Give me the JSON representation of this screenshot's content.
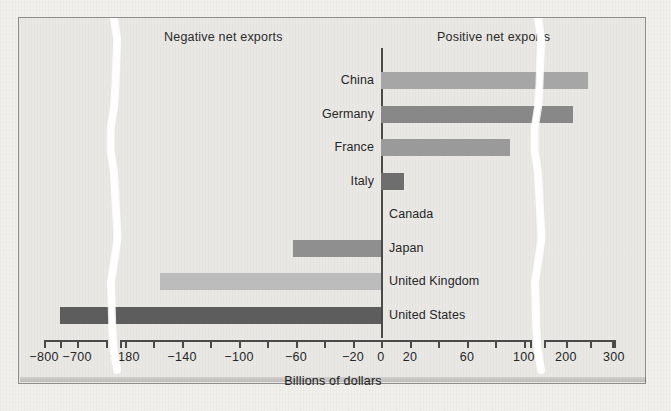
{
  "figure": {
    "header_negative": "Negative net exports",
    "header_positive": "Positive net exports",
    "axis_title": "Billions of dollars"
  },
  "chart_data": {
    "type": "bar",
    "orientation": "horizontal",
    "title": "",
    "subtitle": "",
    "xlabel": "Billions of dollars",
    "ylabel": "",
    "grid": false,
    "legend": null,
    "axis_breaks": [
      {
        "between": [
          -700,
          -180
        ],
        "pixel_x": 113
      },
      {
        "between": [
          100,
          200
        ],
        "pixel_x": 537
      }
    ],
    "xlim": [
      -800,
      300
    ],
    "xticks": [
      -800,
      -700,
      -180,
      -160,
      -140,
      -120,
      -100,
      -80,
      -60,
      -40,
      -20,
      0,
      20,
      40,
      60,
      80,
      100,
      200,
      250,
      300
    ],
    "xtick_labels": [
      "−800",
      "−700",
      "−180",
      "−140",
      "−100",
      "−60",
      "−20",
      "0",
      "20",
      "60",
      "100",
      "200",
      "300"
    ],
    "categories": [
      "China",
      "Germany",
      "France",
      "Italy",
      "Canada",
      "Japan",
      "United Kingdom",
      "United States"
    ],
    "values": [
      245,
      215,
      90,
      16,
      0,
      -62,
      -155,
      -750
    ],
    "annotations": [
      "Negative net exports",
      "Positive net exports"
    ]
  },
  "bars": [
    {
      "label": "China",
      "value": 245,
      "color": "#a6a6a6",
      "label_side": "left"
    },
    {
      "label": "Germany",
      "value": 215,
      "color": "#888888",
      "label_side": "left"
    },
    {
      "label": "France",
      "value": 90,
      "color": "#9a9a9a",
      "label_side": "left"
    },
    {
      "label": "Italy",
      "value": 16,
      "color": "#6e6e6e",
      "label_side": "left"
    },
    {
      "label": "Canada",
      "value": 0,
      "color": "#9a9a9a",
      "label_side": "right"
    },
    {
      "label": "Japan",
      "value": -62,
      "color": "#8f8f8f",
      "label_side": "right"
    },
    {
      "label": "United Kingdom",
      "value": -155,
      "color": "#bcbcbc",
      "label_side": "right"
    },
    {
      "label": "United States",
      "value": -750,
      "color": "#5d5d5d",
      "label_side": "right"
    }
  ],
  "ticks": [
    {
      "value": -800,
      "label": "−800",
      "x": 43,
      "labeled": true
    },
    {
      "value": -750,
      "label": "",
      "x": 59,
      "labeled": false
    },
    {
      "value": -700,
      "label": "−700",
      "x": 76,
      "labeled": true
    },
    {
      "value": -180,
      "label": "−180",
      "x": 124,
      "labeled": true
    },
    {
      "value": -160,
      "label": "",
      "x": 152,
      "labeled": false
    },
    {
      "value": -140,
      "label": "−140",
      "x": 181,
      "labeled": true
    },
    {
      "value": -120,
      "label": "",
      "x": 209,
      "labeled": false
    },
    {
      "value": -100,
      "label": "−100",
      "x": 238,
      "labeled": true
    },
    {
      "value": -80,
      "label": "",
      "x": 266,
      "labeled": false
    },
    {
      "value": -60,
      "label": "−60",
      "x": 295,
      "labeled": true
    },
    {
      "value": -40,
      "label": "",
      "x": 323,
      "labeled": false
    },
    {
      "value": -20,
      "label": "−20",
      "x": 352,
      "labeled": true
    },
    {
      "value": 0,
      "label": "0",
      "x": 380,
      "labeled": true
    },
    {
      "value": 20,
      "label": "20",
      "x": 409,
      "labeled": true
    },
    {
      "value": 40,
      "label": "",
      "x": 437,
      "labeled": false
    },
    {
      "value": 60,
      "label": "60",
      "x": 466,
      "labeled": true
    },
    {
      "value": 80,
      "label": "",
      "x": 494,
      "labeled": false
    },
    {
      "value": 100,
      "label": "100",
      "x": 523,
      "labeled": true
    },
    {
      "value": 200,
      "label": "200",
      "x": 565,
      "labeled": true
    },
    {
      "value": 250,
      "label": "",
      "x": 589,
      "labeled": false
    },
    {
      "value": 300,
      "label": "300",
      "x": 613,
      "labeled": true
    }
  ],
  "colors": {
    "page_background": "#f1f0ed",
    "figure_background": "#e9e8e5",
    "frame": "#8e8e8e",
    "axis": "#4a4a4a",
    "text": "#262626",
    "break_ribbon": "#ffffff"
  }
}
